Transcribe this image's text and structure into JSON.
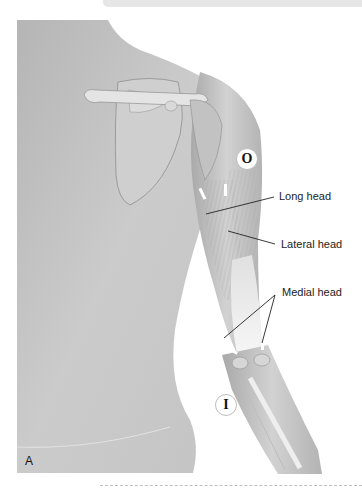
{
  "figure": {
    "panel_letter": "A",
    "labels": {
      "long_head": "Long head",
      "lateral_head": "Lateral head",
      "medial_head": "Medial head"
    },
    "markers": {
      "origin": "O",
      "insertion": "I"
    },
    "colors": {
      "skin": "#c9c9c9",
      "skin_dark": "#a8a8a8",
      "bone": "#e4e4e4",
      "tendon": "#f4f4f4",
      "leader_line": "#222222"
    }
  }
}
